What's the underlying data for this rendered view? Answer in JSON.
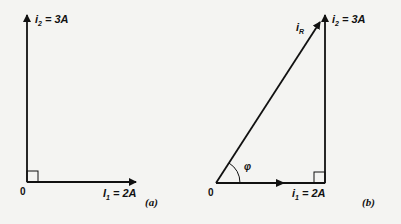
{
  "figure": {
    "panel_a": {
      "caption": "(a)",
      "origin_label": "0",
      "vertical_vector": {
        "name": "i",
        "sub": "2",
        "rest": " = 3A"
      },
      "horizontal_vector": {
        "name": "I",
        "sub": "1",
        "rest": " = 2A"
      },
      "right_angle_marker": true
    },
    "panel_b": {
      "caption": "(b)",
      "origin_label": "0",
      "resultant_vector": {
        "name": "i",
        "sub": "R"
      },
      "vertical_vector": {
        "name": "i",
        "sub": "2",
        "rest": " = 3A"
      },
      "horizontal_vector": {
        "name": "i",
        "sub": "1",
        "rest": " = 2A"
      },
      "angle_label": "φ",
      "right_angle_marker": true
    },
    "colors": {
      "ink": "#111111",
      "background": "#f4f4f2"
    }
  }
}
